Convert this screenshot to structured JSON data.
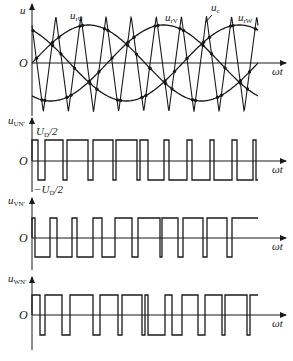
{
  "figure": {
    "background": "#ffffff",
    "ink": "#1a1a1a"
  },
  "top_plot": {
    "y_axis_label": "u",
    "origin_label": "O",
    "x_axis_label": "ωt",
    "signals": [
      {
        "name": "u_rU",
        "label_main": "u",
        "label_sub": "rU",
        "phase_deg": 0
      },
      {
        "name": "u_rV",
        "label_main": "u",
        "label_sub": "rV",
        "phase_deg": -120
      },
      {
        "name": "u_rW",
        "label_main": "u",
        "label_sub": "rW",
        "phase_deg": 120
      }
    ],
    "carrier": {
      "name": "u_c",
      "label_main": "u",
      "label_sub": "c",
      "ratio": 9
    },
    "geometry": {
      "x0": 32,
      "x_end": 258,
      "zero_y": 63,
      "sine_amp": 38,
      "tri_top": 16,
      "tri_bot": 112
    }
  },
  "pwm_plots": [
    {
      "name": "u_UN'",
      "label_main": "u",
      "label_sub": "UN'",
      "origin_label": "O",
      "x_axis_label": "ωt",
      "level_labels": {
        "high": "U_D/2",
        "low": "−U_D/2",
        "high_main": "U",
        "high_sub": "D",
        "high_tail": "/2",
        "low_main": "−U",
        "low_sub": "D",
        "low_tail": "/2"
      },
      "geometry": {
        "label_y": 124,
        "top": 140,
        "zero": 161,
        "bottom": 180
      },
      "start_level": "high",
      "edges": [
        38,
        45,
        63,
        67,
        88,
        93,
        113,
        116,
        137,
        140,
        148,
        164,
        169,
        187,
        192,
        210,
        214,
        232,
        237,
        253,
        256
      ]
    },
    {
      "name": "u_VN'",
      "label_main": "u",
      "label_sub": "VN'",
      "origin_label": "O",
      "x_axis_label": "ωt",
      "geometry": {
        "label_y": 204,
        "top": 218,
        "zero": 238,
        "bottom": 257
      },
      "start_level": "high",
      "edges": [
        35,
        50,
        57,
        72,
        77,
        93,
        102,
        115,
        132,
        138,
        160,
        162,
        178,
        183,
        203,
        207,
        227,
        232
      ]
    },
    {
      "name": "u_WN'",
      "label_main": "u",
      "label_sub": "WN'",
      "origin_label": "O",
      "x_axis_label": "ωt",
      "geometry": {
        "label_y": 282,
        "top": 295,
        "zero": 315,
        "bottom": 335
      },
      "start_level": "high",
      "edges": [
        40,
        45,
        62,
        70,
        93,
        100,
        118,
        122,
        142,
        145,
        148,
        165,
        172,
        182,
        198,
        205,
        222,
        225,
        247,
        250
      ]
    }
  ]
}
